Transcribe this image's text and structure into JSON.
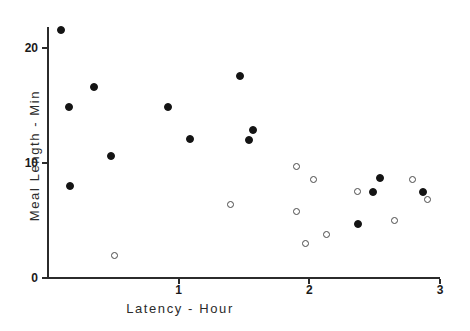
{
  "chart_data": {
    "type": "scatter",
    "title": "",
    "xlabel": "Latency - Hour",
    "ylabel": "Meal Length - Min",
    "xlim": [
      0,
      3
    ],
    "ylim": [
      0,
      23
    ],
    "xticks": [
      "1",
      "2",
      "3"
    ],
    "xtick_values": [
      1,
      2,
      3
    ],
    "yticks": [
      "0",
      "10",
      "20"
    ],
    "ytick_values": [
      0,
      10,
      20
    ],
    "grid": false,
    "legend": "none",
    "series": [
      {
        "name": "filled",
        "marker": "filled-circle",
        "color": "#141414",
        "points": [
          {
            "x": 0.1,
            "y": 21.6
          },
          {
            "x": 0.17,
            "y": 8.0
          },
          {
            "x": 0.16,
            "y": 14.9
          },
          {
            "x": 0.35,
            "y": 16.6
          },
          {
            "x": 0.48,
            "y": 10.6
          },
          {
            "x": 0.92,
            "y": 14.9
          },
          {
            "x": 1.09,
            "y": 12.1
          },
          {
            "x": 1.47,
            "y": 17.6
          },
          {
            "x": 1.54,
            "y": 12.0
          },
          {
            "x": 1.57,
            "y": 12.9
          },
          {
            "x": 2.37,
            "y": 4.7
          },
          {
            "x": 2.49,
            "y": 7.5
          },
          {
            "x": 2.54,
            "y": 8.7
          },
          {
            "x": 2.87,
            "y": 7.5
          }
        ]
      },
      {
        "name": "open",
        "marker": "open-circle",
        "color": "#4a4a4a",
        "points": [
          {
            "x": 0.51,
            "y": 2.0
          },
          {
            "x": 1.4,
            "y": 6.4
          },
          {
            "x": 1.9,
            "y": 9.7
          },
          {
            "x": 2.03,
            "y": 8.6
          },
          {
            "x": 1.9,
            "y": 5.8
          },
          {
            "x": 2.13,
            "y": 3.8
          },
          {
            "x": 1.97,
            "y": 3.0
          },
          {
            "x": 2.37,
            "y": 7.5
          },
          {
            "x": 2.79,
            "y": 8.6
          },
          {
            "x": 2.9,
            "y": 6.8
          },
          {
            "x": 2.65,
            "y": 5.0
          }
        ]
      }
    ]
  },
  "axes": {
    "x_origin_px": 48,
    "y_origin_px": 278,
    "px_per_x_unit": 130.7,
    "px_per_y_unit": 11.5
  }
}
